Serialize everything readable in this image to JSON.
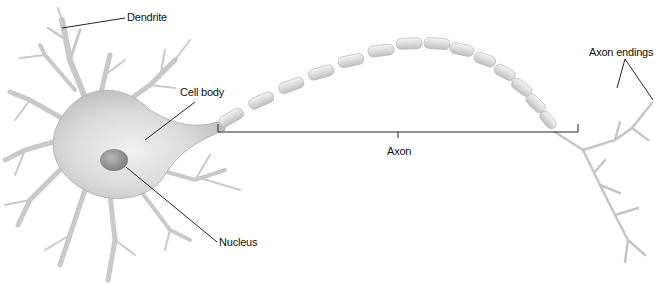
{
  "diagram": {
    "labels": {
      "dendrite": "Dendrite",
      "cell_body": "Cell body",
      "nucleus": "Nucleus",
      "axon": "Axon",
      "axon_endings": "Axon endings"
    },
    "colors": {
      "background": "#ffffff",
      "cell_fill": "#d6d6d6",
      "cell_shade": "#a9a9a9",
      "myelin": "#e2e2e2",
      "line": "#222222"
    }
  }
}
